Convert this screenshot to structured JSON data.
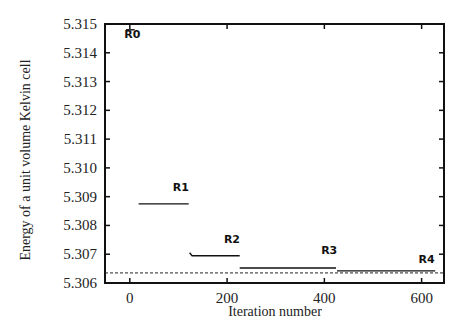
{
  "chart_data": {
    "type": "line",
    "title": "",
    "xlabel": "Iteration number",
    "ylabel": "Energy of a unit volume Kelvin cell",
    "xlim": [
      -51,
      646
    ],
    "ylim": [
      5.306,
      5.315
    ],
    "x_ticks": [
      0,
      200,
      400,
      600
    ],
    "x_tick_labels": [
      "0",
      "200",
      "400",
      "600"
    ],
    "y_ticks": [
      5.306,
      5.307,
      5.308,
      5.309,
      5.31,
      5.311,
      5.312,
      5.313,
      5.314,
      5.315
    ],
    "y_tick_labels": [
      "5.306",
      "5.307",
      "5.308",
      "5.309",
      "5.310",
      "5.311",
      "5.312",
      "5.313",
      "5.314",
      "5.315"
    ],
    "grid": false,
    "legend": null,
    "series": [
      {
        "name": "R0",
        "x": [
          -8,
          10
        ],
        "y": [
          5.3148,
          5.3148
        ]
      },
      {
        "name": "R1",
        "x": [
          18,
          121
        ],
        "y": [
          5.30875,
          5.30875
        ]
      },
      {
        "name": "R2",
        "x": [
          123,
          128,
          226
        ],
        "y": [
          5.30705,
          5.30695,
          5.30695
        ]
      },
      {
        "name": "R3",
        "x": [
          226,
          424
        ],
        "y": [
          5.30652,
          5.30652
        ]
      },
      {
        "name": "R4",
        "x": [
          426,
          628
        ],
        "y": [
          5.30642,
          5.30642
        ]
      }
    ],
    "reference_line": {
      "style": "dashed",
      "y": 5.30635
    },
    "annotations": [
      {
        "text": "R0",
        "x": 5,
        "y": 5.3145
      },
      {
        "text": "R1",
        "x": 105,
        "y": 5.3092
      },
      {
        "text": "R2",
        "x": 210,
        "y": 5.3074
      },
      {
        "text": "R3",
        "x": 410,
        "y": 5.307
      },
      {
        "text": "R4",
        "x": 610,
        "y": 5.3067
      }
    ]
  }
}
